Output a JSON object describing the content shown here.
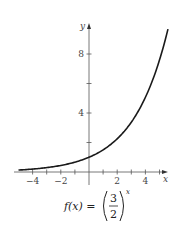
{
  "chart_data": {
    "type": "line",
    "title": "",
    "caption": "f(x) = (3/2)^x",
    "function": "f(x) = (3/2)^x",
    "xlabel": "x",
    "ylabel": "y",
    "xlim": [
      -5,
      5.6
    ],
    "ylim": [
      0,
      10
    ],
    "x_ticks": [
      -4,
      -3,
      -2,
      -1,
      1,
      2,
      3,
      4,
      5
    ],
    "x_tick_labels": [
      "-4",
      "-2",
      "2",
      "4"
    ],
    "x_labeled_ticks": [
      -4,
      -2,
      2,
      4
    ],
    "y_ticks": [
      2,
      4,
      6,
      8
    ],
    "y_tick_labels": [
      "4",
      "8"
    ],
    "y_labeled_ticks": [
      4,
      8
    ],
    "grid": false,
    "legend": null,
    "series": [
      {
        "name": "f(x) = (3/2)^x",
        "x": [
          -5,
          -4,
          -3,
          -2,
          -1,
          0,
          1,
          2,
          3,
          4,
          5,
          5.6
        ],
        "y": [
          0.13,
          0.2,
          0.3,
          0.44,
          0.67,
          1.0,
          1.5,
          2.25,
          3.38,
          5.06,
          7.59,
          9.68
        ]
      }
    ]
  },
  "labels": {
    "x_axis": "x",
    "y_axis": "y",
    "x_ticks": [
      "-4",
      "-2",
      "2",
      "4"
    ],
    "y_ticks": [
      "4",
      "8"
    ],
    "formula_lhs": "f(x) =",
    "formula_num": "3",
    "formula_den": "2",
    "formula_exp": "x"
  },
  "colors": {
    "curve": "#1a1a1a",
    "axis": "#555555",
    "text": "#444444"
  }
}
